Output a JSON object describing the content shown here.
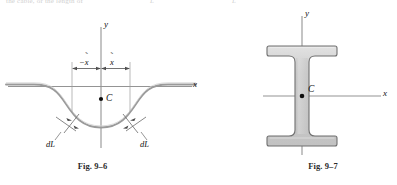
{
  "page": {
    "width": 397,
    "height": 185,
    "background": "#ffffff",
    "top_bleed": {
      "left_fragment": "the cable, or the length of",
      "mid_fragment": "L",
      "right_fragment": "L"
    }
  },
  "figures": [
    {
      "id": "fig-9-6",
      "caption": "Fig. 9–6",
      "description": "Hanging cable (catenary) with centroid C on the y axis; symmetric distances x̃ measured from the y axis; differential arc length dL marked on each side of the curve.",
      "axes": {
        "y_label": "y",
        "x_label": "x",
        "origin_marker": "none"
      },
      "labels": {
        "centroid": "C",
        "dim_left": "−x̃",
        "dim_right": "x̃",
        "element_left": "dL",
        "element_right": "dL"
      },
      "colors": {
        "curve": "#8e8e8e",
        "axis": "#8f8f8f",
        "dimension": "#6f6f6f",
        "text": "#111111"
      }
    },
    {
      "id": "fig-9-7",
      "caption": "Fig. 9–7",
      "description": "Wide-flange (I-shaped) cross section with centroid C at the intersection of the x and y centroidal axes.",
      "axes": {
        "y_label": "y",
        "x_label": "x"
      },
      "labels": {
        "centroid": "C"
      },
      "colors": {
        "fill": "#c9c9c9",
        "fill_highlight": "#dedede",
        "outline": "#6b6b6b",
        "axis": "#8f8f8f",
        "text": "#111111"
      }
    }
  ]
}
